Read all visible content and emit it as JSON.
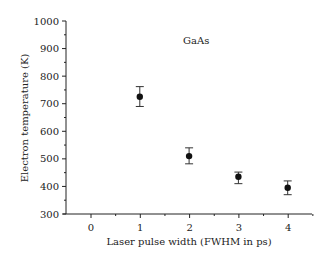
{
  "chart_data": {
    "type": "scatter",
    "title": "",
    "annotation": "GaAs",
    "xlabel": "Laser pulse width (FWHM in ps)",
    "ylabel": "Electron temperature (K)",
    "xlim": [
      -0.5,
      4.5
    ],
    "ylim": [
      300,
      1000
    ],
    "xticks": [
      0,
      1,
      2,
      3,
      4
    ],
    "xtick_labels": [
      "0",
      "1",
      "2",
      "3",
      "4"
    ],
    "yticks": [
      300,
      400,
      500,
      600,
      700,
      800,
      900,
      1000
    ],
    "ytick_labels": [
      "300",
      "400",
      "500",
      "600",
      "700",
      "800",
      "900",
      "1000"
    ],
    "grid": false,
    "legend": null,
    "series": [
      {
        "name": "GaAs",
        "marker": "filled-circle",
        "x": [
          1,
          2,
          3,
          4
        ],
        "y": [
          725,
          510,
          435,
          395
        ],
        "yerr_low": [
          690,
          482,
          410,
          370
        ],
        "yerr_high": [
          762,
          540,
          452,
          420
        ]
      }
    ]
  }
}
